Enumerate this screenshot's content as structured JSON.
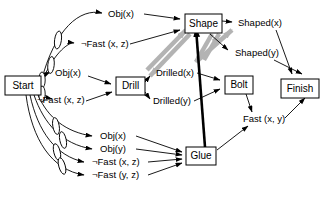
{
  "diagram": {
    "colors": {
      "stroke": "#000000",
      "background": "#ffffff",
      "mutex_gray": "#b3b3b3",
      "highlight_black": "#000000"
    },
    "nodes": [
      {
        "id": "start",
        "label": "Start",
        "x": 5,
        "y": 76,
        "w": 36,
        "h": 19
      },
      {
        "id": "drill",
        "label": "Drill",
        "x": 116,
        "y": 77,
        "w": 29,
        "h": 18
      },
      {
        "id": "shape",
        "label": "Shape",
        "x": 185,
        "y": 14,
        "w": 37,
        "h": 19
      },
      {
        "id": "bolt",
        "label": "Bolt",
        "x": 225,
        "y": 76,
        "w": 28,
        "h": 18
      },
      {
        "id": "glue",
        "label": "Glue",
        "x": 186,
        "y": 147,
        "w": 30,
        "h": 18
      },
      {
        "id": "finish",
        "label": "Finish",
        "x": 281,
        "y": 79,
        "w": 38,
        "h": 19
      }
    ],
    "literals": [
      {
        "id": "obj_x_top",
        "label": "Obj(x)",
        "x": 108,
        "y": 14
      },
      {
        "id": "nfast_xz_up",
        "label": "¬Fast (x, z)",
        "x": 81,
        "y": 44
      },
      {
        "id": "obj_x_mid",
        "label": "Obj(x)",
        "x": 55,
        "y": 73
      },
      {
        "id": "nfast_xz_mid",
        "label": "¬Fast (x, z)",
        "x": 37,
        "y": 100
      },
      {
        "id": "drilled_x",
        "label": "Drilled(x)",
        "x": 156,
        "y": 73
      },
      {
        "id": "drilled_y",
        "label": "Drilled(y)",
        "x": 153,
        "y": 101
      },
      {
        "id": "shaped_x",
        "label": "Shaped(x)",
        "x": 238,
        "y": 23
      },
      {
        "id": "shaped_y",
        "label": "Shaped(y)",
        "x": 235,
        "y": 53
      },
      {
        "id": "fast_xy",
        "label": "Fast (x, y)",
        "x": 243,
        "y": 119
      },
      {
        "id": "obj_x_bot",
        "label": "Obj(x)",
        "x": 100,
        "y": 136
      },
      {
        "id": "obj_y_bot",
        "label": "Obj(y)",
        "x": 100,
        "y": 149
      },
      {
        "id": "nfast_xz_bot",
        "label": "¬Fast (x, z)",
        "x": 92,
        "y": 162
      },
      {
        "id": "nfast_yz_bot",
        "label": "¬Fast (y, z)",
        "x": 92,
        "y": 175
      }
    ],
    "edges": [
      {
        "from": "start",
        "to": "obj_x_top",
        "style": "thin"
      },
      {
        "from": "start",
        "to": "nfast_xz_up",
        "style": "thin"
      },
      {
        "from": "start",
        "to": "obj_x_mid",
        "style": "thin"
      },
      {
        "from": "start",
        "to": "nfast_xz_mid",
        "style": "thin"
      },
      {
        "from": "start",
        "to": "obj_x_bot",
        "style": "thin"
      },
      {
        "from": "start",
        "to": "obj_y_bot",
        "style": "thin"
      },
      {
        "from": "start",
        "to": "nfast_xz_bot",
        "style": "thin"
      },
      {
        "from": "start",
        "to": "nfast_yz_bot",
        "style": "thin"
      },
      {
        "from": "obj_x_top",
        "to": "shape",
        "style": "thin"
      },
      {
        "from": "nfast_xz_up",
        "to": "shape",
        "style": "thin"
      },
      {
        "from": "obj_x_mid",
        "to": "drill",
        "style": "thin"
      },
      {
        "from": "nfast_xz_mid",
        "to": "drill",
        "style": "thin"
      },
      {
        "from": "drill",
        "to": "drilled_x",
        "style": "thin"
      },
      {
        "from": "drill",
        "to": "drilled_y",
        "style": "thin"
      },
      {
        "from": "drill",
        "to": "shape",
        "style": "mutex-gray"
      },
      {
        "from": "shape",
        "to": "drill",
        "style": "mutex-gray"
      },
      {
        "from": "shape",
        "to": "shaped_x",
        "style": "thin"
      },
      {
        "from": "shape",
        "to": "shaped_y",
        "style": "thin"
      },
      {
        "from": "drilled_x",
        "to": "bolt",
        "style": "thin"
      },
      {
        "from": "drilled_y",
        "to": "bolt",
        "style": "thin"
      },
      {
        "from": "bolt",
        "to": "fast_xy",
        "style": "thin"
      },
      {
        "from": "glue",
        "to": "fast_xy",
        "style": "thin"
      },
      {
        "from": "glue",
        "to": "shape",
        "style": "bold"
      },
      {
        "from": "obj_x_bot",
        "to": "glue",
        "style": "thin"
      },
      {
        "from": "obj_y_bot",
        "to": "glue",
        "style": "thin"
      },
      {
        "from": "nfast_xz_bot",
        "to": "glue",
        "style": "thin"
      },
      {
        "from": "nfast_yz_bot",
        "to": "glue",
        "style": "thin"
      },
      {
        "from": "shaped_x",
        "to": "finish",
        "style": "thin"
      },
      {
        "from": "shaped_y",
        "to": "finish",
        "style": "thin"
      },
      {
        "from": "fast_xy",
        "to": "finish",
        "style": "thin"
      }
    ],
    "persistence_markers": {
      "count": 6,
      "shape": "narrow-vertical-ellipse",
      "note": "no-op / persistence links drawn on Start outgoing arcs"
    }
  }
}
